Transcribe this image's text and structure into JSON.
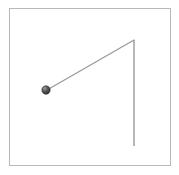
{
  "figure": {
    "name": "pendulum-diagram",
    "background_color": "#ffffff",
    "frame": {
      "border_color": "#b8b8b8",
      "border_width": 1,
      "fill_color": "#ffffff",
      "x": 9,
      "y": 8,
      "width": 162,
      "height": 158
    },
    "pivot": {
      "label": "pivot-point",
      "x": 134,
      "y": 40
    },
    "vertical_reference_line": {
      "label": "vertical-reference-line",
      "color": "#9a9a9a",
      "width": 1.4,
      "x1": 134,
      "y1": 40,
      "x2": 134,
      "y2": 146
    },
    "pendulum_string": {
      "label": "pendulum-string",
      "color": "#9a9a9a",
      "width": 1.3,
      "x1": 134,
      "y1": 40,
      "x2": 47,
      "y2": 90
    },
    "bob": {
      "label": "pendulum-bob",
      "cx": 46,
      "cy": 90,
      "radius": 4.2,
      "fill_color": "#555555",
      "highlight_color": "#8c8c8c",
      "shade_color": "#2e2e2e"
    }
  }
}
